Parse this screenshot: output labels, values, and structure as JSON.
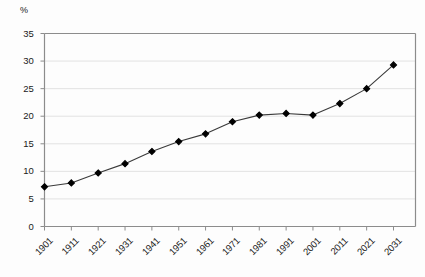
{
  "chart": {
    "unit_label": "%",
    "y_ticks": [
      "0",
      "5",
      "10",
      "15",
      "20",
      "25",
      "30",
      "35"
    ],
    "x_ticks": [
      "1901",
      "1911",
      "1921",
      "1931",
      "1941",
      "1951",
      "1961",
      "1971",
      "1981",
      "1991",
      "2001",
      "2011",
      "2021",
      "2031"
    ],
    "marker_color": "#000000",
    "line_color": "#3a3a3a",
    "grid_color": "#e2e2e2",
    "axis_color": "#8c8c8c"
  },
  "chart_data": {
    "type": "line",
    "title": "",
    "subtitle": "",
    "xlabel": "",
    "ylabel": "%",
    "categories": [
      "1901",
      "1911",
      "1921",
      "1931",
      "1941",
      "1951",
      "1961",
      "1971",
      "1981",
      "1991",
      "2001",
      "2011",
      "2021",
      "2031"
    ],
    "x": [
      1901,
      1911,
      1921,
      1931,
      1941,
      1951,
      1961,
      1971,
      1981,
      1991,
      2001,
      2011,
      2021,
      2031
    ],
    "values": [
      7.2,
      7.9,
      9.7,
      11.4,
      13.6,
      15.4,
      16.8,
      19.0,
      20.2,
      20.5,
      20.2,
      22.3,
      25.0,
      29.3
    ],
    "ylim": [
      0,
      35
    ],
    "ytick_step": 5,
    "grid": "horizontal",
    "legend": "none",
    "markers": "filled-diamond",
    "annotations": []
  }
}
